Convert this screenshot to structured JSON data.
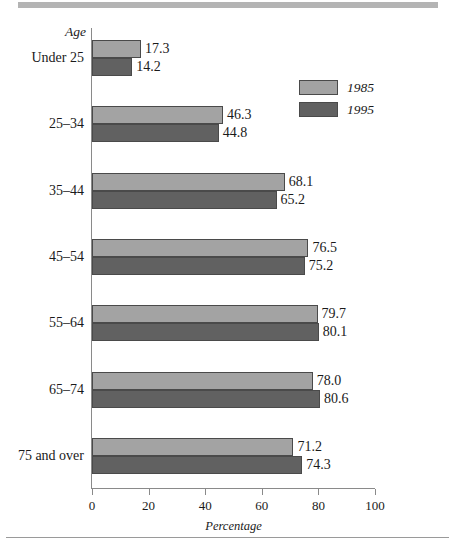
{
  "figure": {
    "axis_name_label": "Age",
    "legend": [
      {
        "label": "1985",
        "color": "#a3a3a3",
        "icon": "legend-swatch-light"
      },
      {
        "label": "1995",
        "color": "#616161",
        "icon": "legend-swatch-dark"
      }
    ],
    "colors": {
      "series_1985": "#a3a3a3",
      "series_1995": "#616161",
      "axis": "#8a8a8a",
      "rule": "#b4b4b4",
      "background": "#ffffff",
      "text": "#1a1a1a"
    }
  },
  "chart_data": {
    "type": "bar",
    "orientation": "horizontal",
    "title": "",
    "subtitle": "",
    "xlabel": "Percentage",
    "ylabel": "Age",
    "xlim": [
      0,
      100
    ],
    "xticks": [
      0,
      20,
      40,
      60,
      80,
      100
    ],
    "xtick_labels": [
      "0",
      "20",
      "40",
      "60",
      "80",
      "100"
    ],
    "grid": false,
    "legend_position": "top-right",
    "categories": [
      "Under 25",
      "25–34",
      "35–44",
      "45–54",
      "55–64",
      "65–74",
      "75 and over"
    ],
    "series": [
      {
        "name": "1985",
        "color": "#a3a3a3",
        "values": [
          17.3,
          46.3,
          68.1,
          76.5,
          79.7,
          78.0,
          71.2
        ],
        "value_labels": [
          "17.3",
          "46.3",
          "68.1",
          "76.5",
          "79.7",
          "78.0",
          "71.2"
        ]
      },
      {
        "name": "1995",
        "color": "#616161",
        "values": [
          14.2,
          44.8,
          65.2,
          75.2,
          80.1,
          80.6,
          74.3
        ],
        "value_labels": [
          "14.2",
          "44.8",
          "65.2",
          "75.2",
          "80.1",
          "80.6",
          "74.3"
        ]
      }
    ]
  }
}
